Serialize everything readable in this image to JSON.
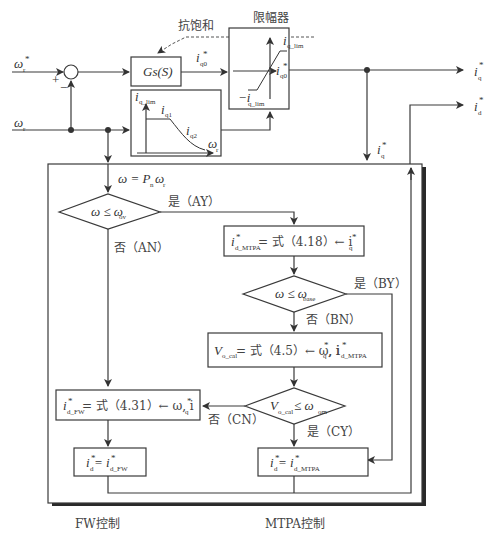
{
  "diagram": {
    "inputs": {
      "omega_r_star": "ω",
      "omega_r_star_sub": "r",
      "omega_r": "ω",
      "omega_r_sub": "r",
      "plus": "+",
      "minus": "−"
    },
    "anti_windup_label": "抗饱和",
    "limiter_title": "限幅器",
    "controller_label": "Gs(S)",
    "iq0_label": "i",
    "iq0_sub": "q0",
    "limiter": {
      "upper": "i",
      "upper_sub": "q_lim",
      "lower": "−i",
      "lower_sub": "q_lim",
      "out": "i",
      "out_sub": "q0"
    },
    "curve_box": {
      "y_label": "i",
      "y_label_sub": "q_lim",
      "seg1": "i",
      "seg1_sub": "q1",
      "seg2": "i",
      "seg2_sub": "q2",
      "x_label": "ω",
      "x_label_sub": "r"
    },
    "outputs": {
      "iq": "i",
      "iq_sub": "q",
      "id": "i",
      "id_sub": "d",
      "iq_feed": "i",
      "iq_feed_sub": "q"
    },
    "flow": {
      "omega_eq": "ω = P",
      "omega_eq_sub1": "n",
      "omega_eq_tail": "ω",
      "omega_eq_sub2": "r",
      "dec_a": "ω ≤ ω",
      "dec_a_sub": "ov",
      "yes_a": "是（AY）",
      "no_a": "否（AN）",
      "mtpa_box_pre": "i",
      "mtpa_box_sub": "d_MTPA",
      "mtpa_box_eq": "= 式（4.18）← i",
      "mtpa_box_eq_sub": "q",
      "dec_b": "ω ≤ ω",
      "dec_b_sub": "base",
      "yes_b": "是（BY）",
      "no_b": "否（BN）",
      "vcal_box_pre": "V",
      "vcal_box_sub": "o_cal",
      "vcal_box_eq": "= 式（4.5）← ω, i",
      "vcal_box_eq_sub1": "q",
      "vcal_box_eq_mid": ", i",
      "vcal_box_eq_sub2": "d_MTPA",
      "dec_c_pre": "V",
      "dec_c_sub": "o_cal",
      "dec_c_op": " ≤ ω",
      "dec_c_sub2": "om",
      "yes_c": "是（CY）",
      "no_c": "否（CN）",
      "fw_box_pre": "i",
      "fw_box_sub": "d_FW",
      "fw_box_eq": "= 式（4.31）← ω, i",
      "fw_box_eq_sub": "q",
      "fw_out_pre": "i",
      "fw_out_sub": "d",
      "fw_out_eq": " = i",
      "fw_out_eq_sub": "d_FW",
      "mtpa_out_pre": "i",
      "mtpa_out_sub": "d",
      "mtpa_out_eq": " = i",
      "mtpa_out_eq_sub": "d_MTPA"
    },
    "captions": {
      "fw": "FW控制",
      "mtpa": "MTPA控制"
    },
    "star": "*"
  }
}
